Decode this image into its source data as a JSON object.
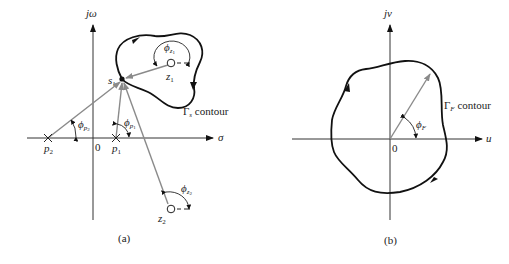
{
  "figure_a": {
    "caption": "(a)",
    "vertical_axis": "jω",
    "horizontal_axis": "σ",
    "origin": "0",
    "test_point": "s",
    "test_point_sub": "1",
    "contour_label_symbol": "Γ",
    "contour_label_sub": "s",
    "contour_label_text": " contour",
    "poles": [
      {
        "name": "p",
        "sub": "2"
      },
      {
        "name": "p",
        "sub": "1"
      }
    ],
    "zeros": [
      {
        "name": "z",
        "sub": "1"
      },
      {
        "name": "z",
        "sub": "2"
      }
    ],
    "angles": [
      {
        "sym": "ϕ",
        "sub": "p",
        "subsub": "2"
      },
      {
        "sym": "ϕ",
        "sub": "p",
        "subsub": "1"
      },
      {
        "sym": "ϕ",
        "sub": "z",
        "subsub": "1"
      },
      {
        "sym": "ϕ",
        "sub": "z",
        "subsub": "2"
      }
    ]
  },
  "figure_b": {
    "caption": "(b)",
    "vertical_axis": "jv",
    "horizontal_axis": "u",
    "origin": "0",
    "contour_label_symbol": "Γ",
    "contour_label_sub": "F",
    "contour_label_text": " contour",
    "angle": {
      "sym": "ϕ",
      "sub": "F"
    }
  },
  "colors": {
    "vector": "#8a8a8a",
    "contour": "#111111",
    "axis": "#333333"
  }
}
